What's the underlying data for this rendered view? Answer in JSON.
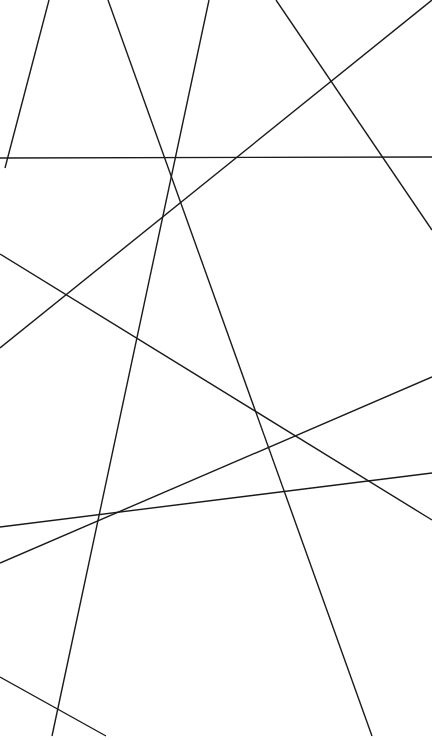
{
  "figure": {
    "background_color": "#ffffff",
    "stroke_color": "#1a1a1a",
    "stroke_width": 1.4,
    "width": 432,
    "height": 740
  },
  "chart_data": {
    "type": "line",
    "subtitle": "",
    "xlabel": "",
    "ylabel": "",
    "xlim": [
      0,
      432
    ],
    "ylim": [
      0,
      740
    ],
    "grid": false,
    "legend": "none",
    "annotations": [],
    "background_color": "#ffffff",
    "stroke_color": "#1a1a1a",
    "stroke_width": 1.4,
    "segment_count": 9,
    "series": [
      {
        "name": "segment-1",
        "x": [
          49,
          5
        ],
        "y": [
          0,
          168
        ],
        "start_edge": "top",
        "end_edge": "left"
      },
      {
        "name": "segment-2",
        "x": [
          108,
          372
        ],
        "y": [
          0,
          736
        ],
        "start_edge": "top",
        "end_edge": "bottom"
      },
      {
        "name": "segment-3",
        "x": [
          209,
          52
        ],
        "y": [
          0,
          736
        ],
        "start_edge": "top",
        "end_edge": "bottom"
      },
      {
        "name": "segment-4",
        "x": [
          276,
          432
        ],
        "y": [
          0,
          230
        ],
        "start_edge": "top",
        "end_edge": "right"
      },
      {
        "name": "segment-5",
        "x": [
          0,
          432
        ],
        "y": [
          158,
          157
        ],
        "start_edge": "left",
        "end_edge": "right"
      },
      {
        "name": "segment-6",
        "x": [
          0,
          432
        ],
        "y": [
          254,
          520
        ],
        "start_edge": "left",
        "end_edge": "right"
      },
      {
        "name": "segment-7",
        "x": [
          0,
          432
        ],
        "y": [
          348,
          0
        ],
        "start_edge": "left",
        "end_edge": "top"
      },
      {
        "name": "segment-8",
        "x": [
          0,
          432
        ],
        "y": [
          527,
          473
        ],
        "start_edge": "left",
        "end_edge": "right"
      },
      {
        "name": "segment-9",
        "x": [
          0,
          432
        ],
        "y": [
          563,
          377
        ],
        "start_edge": "left",
        "end_edge": "right"
      },
      {
        "name": "segment-10",
        "x": [
          0,
          106
        ],
        "y": [
          677,
          736
        ],
        "start_edge": "left",
        "end_edge": "bottom"
      }
    ],
    "crossings": [
      {
        "x": 177,
        "y": 628
      },
      {
        "x": 298,
        "y": 435
      },
      {
        "x": 349,
        "y": 358
      },
      {
        "x": 58,
        "y": 548
      },
      {
        "x": 37,
        "y": 550
      },
      {
        "x": 120,
        "y": 158
      },
      {
        "x": 222,
        "y": 158
      },
      {
        "x": 380,
        "y": 157
      },
      {
        "x": 103,
        "y": 185
      }
    ]
  }
}
